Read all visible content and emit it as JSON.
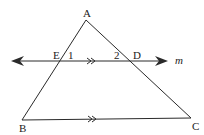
{
  "diagram": {
    "type": "geometry",
    "colors": {
      "stroke": "#2a2a2a",
      "text": "#222222",
      "background": "#ffffff"
    },
    "points": {
      "A": {
        "label": "A",
        "x": 86,
        "y": 20
      },
      "B": {
        "label": "B",
        "x": 22,
        "y": 120
      },
      "C": {
        "label": "C",
        "x": 191,
        "y": 120
      },
      "E": {
        "label": "E",
        "x": 58,
        "y": 61
      },
      "D": {
        "label": "D",
        "x": 130,
        "y": 61
      }
    },
    "line_m": {
      "label": "m",
      "y": 61,
      "x_start": 12,
      "x_end": 168
    },
    "angles": {
      "angle1": "1",
      "angle2": "2"
    },
    "parallel_marks": {
      "on_m": ">>",
      "on_bc": ">>"
    }
  }
}
